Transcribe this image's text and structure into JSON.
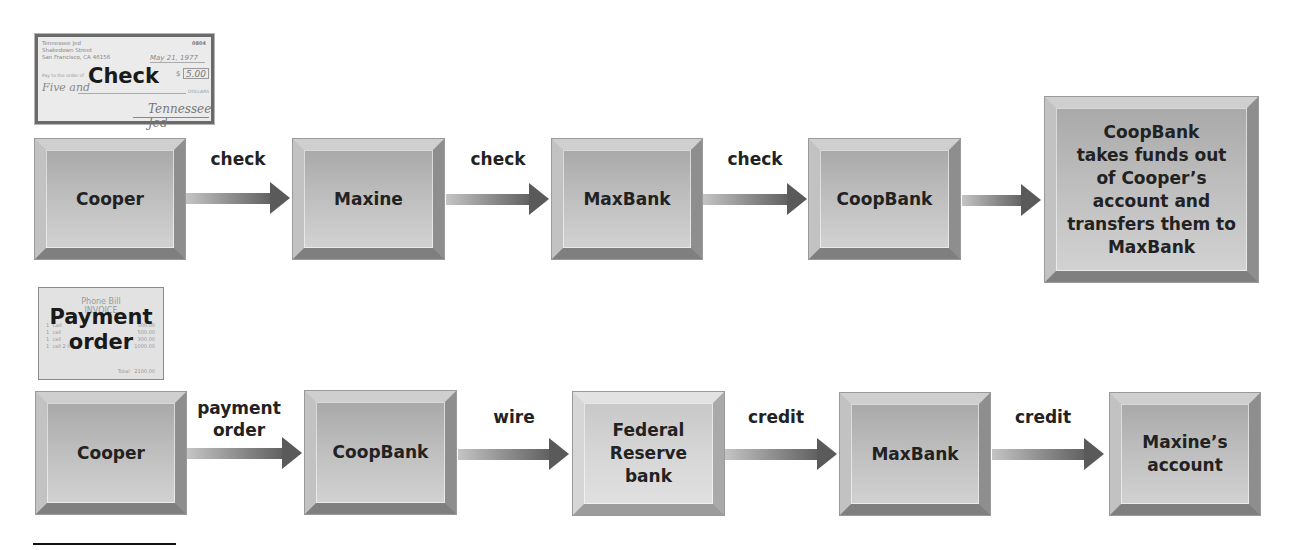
{
  "top_flow": {
    "document": {
      "title": "Check",
      "drawer_address": [
        "Tennessee Jed",
        "Shakedown Street",
        "San Francisco, CA 46156"
      ],
      "check_number": "0804",
      "date": "May 21, 1977",
      "pay_to_label": "Pay to the order of",
      "currency_symbol": "$",
      "amount": "5.00",
      "amount_words": "Five and",
      "dollars_label": "DOLLARS",
      "signature": "Tennessee Jed"
    },
    "nodes": [
      {
        "label": "Cooper"
      },
      {
        "label": "Maxine"
      },
      {
        "label": "MaxBank"
      },
      {
        "label": "CoopBank"
      },
      {
        "label": "CoopBank takes funds out of Cooper’s account and transfers them to MaxBank"
      }
    ],
    "node_lines": {
      "last": [
        "CoopBank",
        "takes funds out",
        "of Cooper’s",
        "account and",
        "transfers them to",
        "MaxBank"
      ]
    },
    "edges": [
      {
        "from": "Cooper",
        "to": "Maxine",
        "label": "check"
      },
      {
        "from": "Maxine",
        "to": "MaxBank",
        "label": "check"
      },
      {
        "from": "MaxBank",
        "to": "CoopBank",
        "label": "check"
      },
      {
        "from": "CoopBank",
        "to": "CoopBank takes funds out...",
        "label": ""
      }
    ]
  },
  "bottom_flow": {
    "document": {
      "title_line1": "Payment",
      "title_line2": "order",
      "header_line1": "Phone Bill",
      "header_line2": "INVOICE",
      "rows": [
        {
          "qty": "1",
          "item": "Call",
          "amount": "500.00"
        },
        {
          "qty": "1",
          "item": "call",
          "amount": "500.00"
        },
        {
          "qty": "1",
          "item": "call",
          "amount": "300.00"
        },
        {
          "qty": "1",
          "item": "call 2 hr",
          "amount": "1000.00"
        }
      ],
      "total_label": "Total",
      "total_value": "2100.00"
    },
    "nodes": [
      {
        "label": "Cooper"
      },
      {
        "label": "CoopBank"
      },
      {
        "label": "Federal Reserve bank"
      },
      {
        "label": "MaxBank"
      },
      {
        "label": "Maxine’s account"
      }
    ],
    "node_lines": {
      "fed": [
        "Federal",
        "Reserve",
        "bank"
      ],
      "maxine": [
        "Maxine’s",
        "account"
      ]
    },
    "edges": [
      {
        "from": "Cooper",
        "to": "CoopBank",
        "label": "payment order",
        "lines": [
          "payment",
          "order"
        ]
      },
      {
        "from": "CoopBank",
        "to": "Federal Reserve bank",
        "label": "wire"
      },
      {
        "from": "Federal Reserve bank",
        "to": "MaxBank",
        "label": "credit"
      },
      {
        "from": "MaxBank",
        "to": "Maxine’s account",
        "label": "credit"
      }
    ]
  },
  "colors": {
    "box_fill": "#bdbdbd",
    "box_fill_light": "#d6d6d6",
    "arrow_dark": "#5a5a5a",
    "text": "#222222"
  }
}
